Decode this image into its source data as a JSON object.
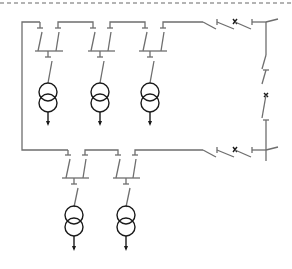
{
  "diagram": {
    "type": "single-line electrical distribution diagram",
    "colors": {
      "line": "#6e6e6e",
      "symbol": "#1a1a1a",
      "border_dash": "#9a9a9a",
      "background": "#ffffff"
    },
    "upper_section": {
      "transformer_count": 3,
      "bays": [
        {
          "id": "T1",
          "center_x": 48
        },
        {
          "id": "T2",
          "center_x": 100
        },
        {
          "id": "T3",
          "center_x": 150
        }
      ]
    },
    "lower_section": {
      "transformer_count": 2,
      "bays": [
        {
          "id": "T4",
          "center_x": 73
        },
        {
          "id": "T5",
          "center_x": 125
        }
      ]
    },
    "symbols": [
      "disconnect-switch-icon",
      "circuit-breaker-icon",
      "transformer-icon",
      "load-arrow-icon",
      "busbar"
    ]
  }
}
